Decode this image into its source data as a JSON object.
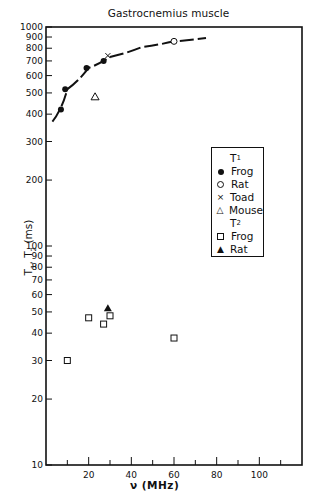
{
  "chart_data": {
    "type": "scatter",
    "title": "Gastrocnemius muscle",
    "xlabel": "ν (MHz)",
    "ylabel": "T1, T2 (ms)",
    "xlim": [
      0,
      120
    ],
    "ylim": [
      10,
      1000
    ],
    "yscale": "log",
    "x_ticks": [
      20,
      40,
      60,
      80,
      100
    ],
    "x_minor_ticks": [
      10,
      30,
      50,
      70,
      90,
      110
    ],
    "y_ticks": [
      10,
      20,
      30,
      40,
      50,
      60,
      70,
      80,
      90,
      100,
      200,
      300,
      400,
      500,
      600,
      700,
      800,
      900,
      1000
    ],
    "grid": false,
    "legend_position": "right-middle inside plot",
    "legend_groups": [
      {
        "heading": "T1",
        "entries": [
          "Frog",
          "Rat",
          "Toad",
          "Mouse"
        ]
      },
      {
        "heading": "T2",
        "entries": [
          "Frog",
          "Rat"
        ]
      }
    ],
    "series": [
      {
        "name": "T1 Frog",
        "marker": "filled-circle",
        "points": [
          [
            7,
            420
          ],
          [
            9,
            520
          ],
          [
            19,
            650
          ],
          [
            27,
            700
          ]
        ]
      },
      {
        "name": "T1 Rat",
        "marker": "open-circle",
        "points": [
          [
            60,
            860
          ]
        ]
      },
      {
        "name": "T1 Toad",
        "marker": "x",
        "points": [
          [
            29,
            740
          ]
        ]
      },
      {
        "name": "T1 Mouse",
        "marker": "open-triangle",
        "points": [
          [
            23,
            480
          ]
        ]
      },
      {
        "name": "T2 Frog",
        "marker": "open-square",
        "points": [
          [
            10,
            30
          ],
          [
            20,
            47
          ],
          [
            27,
            44
          ],
          [
            30,
            48
          ],
          [
            60,
            38
          ]
        ]
      },
      {
        "name": "T2 Rat",
        "marker": "filled-triangle",
        "points": [
          [
            29,
            52
          ]
        ]
      },
      {
        "name": "T1 fit curve",
        "marker": "line",
        "points": [
          [
            3,
            370
          ],
          [
            7,
            430
          ],
          [
            10,
            520
          ],
          [
            20,
            650
          ],
          [
            30,
            730
          ],
          [
            45,
            810
          ],
          [
            60,
            860
          ],
          [
            75,
            890
          ]
        ]
      }
    ]
  },
  "title": "Gastrocnemius muscle",
  "ylabel_main": "T",
  "ylabel_sub1": "1",
  "ylabel_sep": ", T",
  "ylabel_sub2": "2",
  "ylabel_unit": " (ms)",
  "xlabel": "ν (MHz)",
  "legend": {
    "t1_main": "T",
    "t1_sub": "1",
    "t1_items": [
      "Frog",
      "Rat",
      "Toad",
      "Mouse"
    ],
    "t2_main": "T",
    "t2_sub": "2",
    "t2_items": [
      "Frog",
      "Rat"
    ]
  }
}
